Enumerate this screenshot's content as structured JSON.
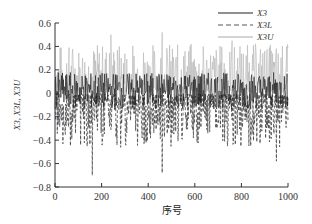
{
  "chart_data": {
    "type": "line",
    "title": "",
    "xlabel": "序号",
    "ylabel": "X3, X3L, X3U",
    "xlim": [
      0,
      1000
    ],
    "ylim": [
      -0.8,
      0.6
    ],
    "x_ticks": [
      "0",
      "200",
      "400",
      "600",
      "800",
      "1000"
    ],
    "y_ticks": [
      "0.6",
      "0.4",
      "0.2",
      "0",
      "-0.2",
      "-0.4",
      "-0.6",
      "-0.8"
    ],
    "grid": false,
    "legend_position": "upper right",
    "series": [
      {
        "name": "X3",
        "style": "solid",
        "color": "#222222",
        "approx_range": [
          -0.15,
          0.2
        ],
        "mean": 0.02
      },
      {
        "name": "X3L",
        "style": "dashed",
        "color": "#555555",
        "approx_range": [
          -0.72,
          0.0
        ],
        "mean": -0.15,
        "notable_minima": [
          {
            "x": 160,
            "y": -0.7
          },
          {
            "x": 460,
            "y": -0.68
          },
          {
            "x": 950,
            "y": -0.58
          },
          {
            "x": 840,
            "y": -0.45
          }
        ]
      },
      {
        "name": "X3U",
        "style": "solid-light",
        "color": "#aaaaaa",
        "approx_range": [
          0.0,
          0.52
        ],
        "mean": 0.2,
        "notable_maxima": [
          {
            "x": 240,
            "y": 0.5
          },
          {
            "x": 460,
            "y": 0.52
          },
          {
            "x": 760,
            "y": 0.45
          }
        ]
      }
    ]
  }
}
